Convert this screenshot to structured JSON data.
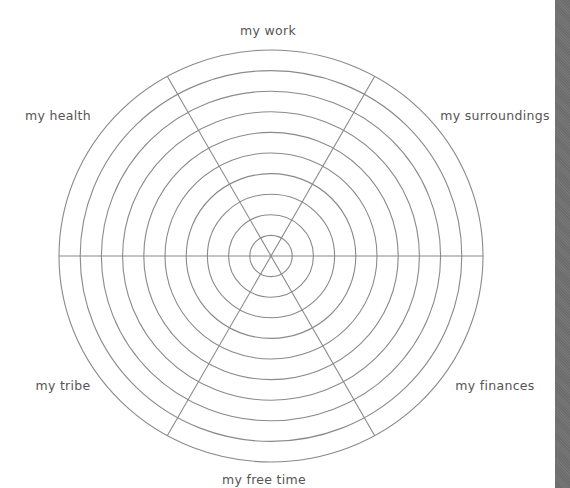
{
  "diagram": {
    "type": "wheel-of-life",
    "rings": 10,
    "segments": 6,
    "center": {
      "x": 271,
      "y": 256
    },
    "outer_radius": {
      "rx": 212,
      "ry": 206
    },
    "line_color": "#8a8a8a",
    "label_color": "#555555",
    "labels": [
      {
        "text": "my work",
        "x": 268,
        "y": 31
      },
      {
        "text": "my surroundings",
        "x": 495,
        "y": 116
      },
      {
        "text": "my finances",
        "x": 495,
        "y": 386
      },
      {
        "text": "my free time",
        "x": 264,
        "y": 480
      },
      {
        "text": "my tribe",
        "x": 63,
        "y": 386
      },
      {
        "text": "my health",
        "x": 58,
        "y": 116
      }
    ]
  },
  "side_bar": {
    "color": "#707070"
  }
}
